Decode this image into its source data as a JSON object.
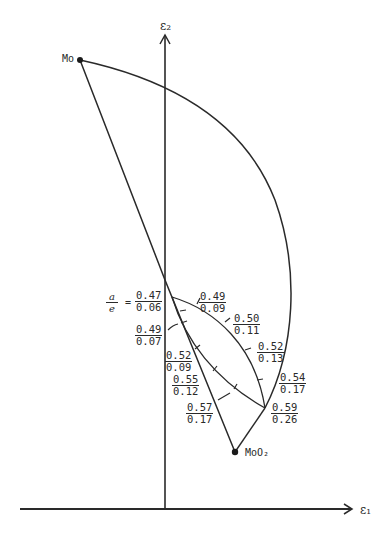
{
  "diagram": {
    "axes": {
      "x_label": "ε₁",
      "y_label": "ε₂"
    },
    "points": {
      "mo": {
        "label": "Mo"
      },
      "moo2": {
        "label": "MoO₂"
      }
    },
    "ratio_label": {
      "numerator": "a",
      "denominator": "e",
      "equals": "="
    },
    "annotations": [
      {
        "num": "0.47",
        "den": "0.06"
      },
      {
        "num": "0.49",
        "den": "0.09"
      },
      {
        "num": "0.50",
        "den": "0.11"
      },
      {
        "num": "0.49",
        "den": "0.07"
      },
      {
        "num": "0.52",
        "den": "0.13"
      },
      {
        "num": "0.52",
        "den": "0.09"
      },
      {
        "num": "0.55",
        "den": "0.12"
      },
      {
        "num": "0.54",
        "den": "0.17"
      },
      {
        "num": "0.57",
        "den": "0.17"
      },
      {
        "num": "0.59",
        "den": "0.26"
      }
    ]
  }
}
